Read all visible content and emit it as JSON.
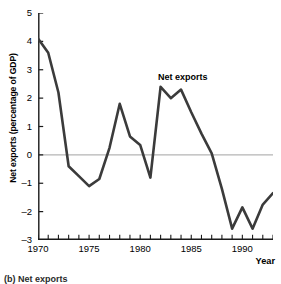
{
  "chart_data": {
    "type": "line",
    "title": "",
    "xlabel": "Year",
    "ylabel": "Net exports (percentage of GDP)",
    "xlim": [
      1970,
      1993
    ],
    "ylim": [
      -3,
      5
    ],
    "yticks": [
      5,
      4,
      3,
      2,
      1,
      0,
      -1,
      -2,
      -3
    ],
    "ytick_labels": [
      "5",
      "4",
      "3",
      "2",
      "1",
      "0",
      "–1",
      "–2",
      "–3"
    ],
    "xticks": [
      1970,
      1971,
      1972,
      1973,
      1974,
      1975,
      1976,
      1977,
      1978,
      1979,
      1980,
      1981,
      1982,
      1983,
      1984,
      1985,
      1986,
      1987,
      1988,
      1989,
      1990,
      1991,
      1992,
      1993
    ],
    "xtick_labels": [
      "1970",
      "1975",
      "1980",
      "1985",
      "1990"
    ],
    "xtick_label_values": [
      1970,
      1975,
      1980,
      1985,
      1990
    ],
    "grid": false,
    "zero_line": 0,
    "legend_position": "inline-annotation",
    "series": [
      {
        "name": "Net exports",
        "color": "#3b3b3b",
        "x": [
          1970,
          1971,
          1972,
          1973,
          1974,
          1975,
          1976,
          1977,
          1978,
          1979,
          1980,
          1981,
          1982,
          1983,
          1984,
          1985,
          1986,
          1987,
          1988,
          1989,
          1990,
          1991,
          1992,
          1993
        ],
        "values": [
          4.1,
          3.6,
          2.2,
          -0.4,
          -0.75,
          -1.1,
          -0.85,
          0.25,
          1.8,
          0.65,
          0.35,
          -0.8,
          2.4,
          2.0,
          2.3,
          1.5,
          0.75,
          0.05,
          -1.2,
          -2.6,
          -1.85,
          -2.6,
          -1.75,
          -1.35
        ]
      }
    ],
    "annotations": [
      {
        "text": "Net exports",
        "x": 1984.5,
        "y": 2.95
      }
    ]
  },
  "axis": {
    "y_title": "Net exports (percentage of GDP)",
    "x_title": "Year"
  },
  "caption": {
    "text": "(b) Net exports"
  },
  "colors": {
    "line": "#3b3b3b",
    "axis": "#1a1a1a",
    "zero_line": "#b5b5b5",
    "background": "#ffffff"
  }
}
